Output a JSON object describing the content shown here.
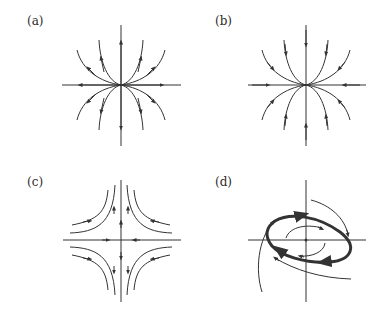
{
  "figure": {
    "panels": [
      {
        "id": "a",
        "label": "(a)",
        "type": "unstable-node",
        "description": "trajectories flow outward from origin"
      },
      {
        "id": "b",
        "label": "(b)",
        "type": "stable-node",
        "description": "trajectories flow inward to origin"
      },
      {
        "id": "c",
        "label": "(c)",
        "type": "saddle",
        "description": "inflow along horizontal axis, outflow along vertical axis"
      },
      {
        "id": "d",
        "label": "(d)",
        "type": "stable-limit-cycle",
        "description": "thick closed orbit; inner spiral outward, outer trajectories inward"
      }
    ],
    "colors": {
      "line": "#333333",
      "background": "#ffffff"
    }
  }
}
